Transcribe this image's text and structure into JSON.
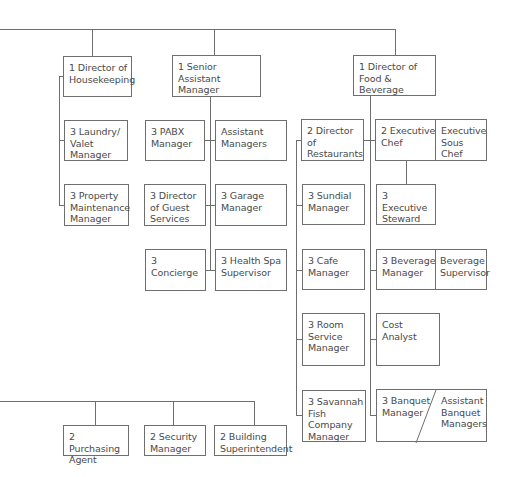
{
  "chart": {
    "type": "org-chart",
    "nodes": {
      "housekeeping": "1 Director of Housekeeping",
      "senior_asst": "1 Senior Assistant Manager",
      "fnb": "1 Director of Food & Beverage",
      "laundry": "3 Laundry/ Valet Manager",
      "property": "3 Property Maintenance Manager",
      "pabx": "3 PABX Manager",
      "asst_managers": "Assistant Managers",
      "guest_services": "3 Director of Guest Services",
      "garage": "3 Garage Manager",
      "concierge": "3 Concierge",
      "health_spa": "3 Health Spa Supervisor",
      "restaurants": "2 Director of Restaurants",
      "sundial": "3 Sundial Manager",
      "cafe": "3 Cafe Manager",
      "room_service": "3 Room Service Manager",
      "savannah": "3 Savannah Fish Company Manager",
      "exec_chef": "2 Executive Chef",
      "sous_chef": "Executive Sous Chef",
      "exec_steward": "3 Executive Steward",
      "beverage_mgr": "3 Beverage Manager",
      "beverage_sup": "Beverage Supervisor",
      "cost_analyst": "Cost Analyst",
      "banquet_mgr": "3 Banquet Manager",
      "asst_banquet": "Assistant Banquet Managers",
      "purchasing": "2 Purchasing Agent",
      "security": "2 Security Manager",
      "building": "2 Building Superintendent"
    },
    "colors": {
      "line": "#6e6e6e",
      "text": "#4a4a4a",
      "background": "#ffffff"
    }
  }
}
